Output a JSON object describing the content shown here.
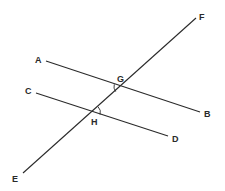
{
  "diagram": {
    "type": "parallel-lines-with-transversal",
    "lines": [
      {
        "name": "AB",
        "start_label": "A",
        "end_label": "B"
      },
      {
        "name": "CD",
        "start_label": "C",
        "end_label": "D"
      },
      {
        "name": "EF",
        "start_label": "E",
        "end_label": "F",
        "role": "transversal"
      }
    ],
    "points": {
      "A": "A",
      "B": "B",
      "C": "C",
      "D": "D",
      "E": "E",
      "F": "F",
      "G": "G",
      "H": "H"
    },
    "intersections": [
      {
        "label": "G",
        "lines": [
          "AB",
          "EF"
        ],
        "angle_marked": "left-below"
      },
      {
        "label": "H",
        "lines": [
          "CD",
          "EF"
        ],
        "angle_marked": "right-above"
      }
    ],
    "colors": {
      "stroke": "#2a2a2a",
      "background": "#ffffff"
    }
  }
}
